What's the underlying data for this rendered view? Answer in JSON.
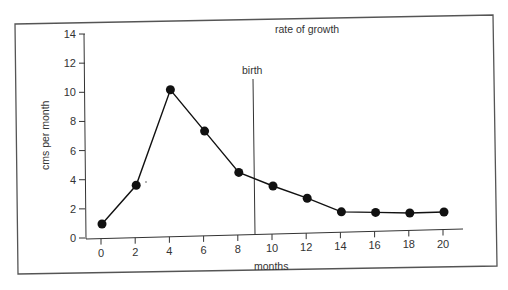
{
  "chart_data": {
    "type": "line",
    "title": "rate of growth",
    "xlabel": "months",
    "ylabel": "cms per month",
    "x": [
      0,
      2,
      4,
      6,
      8,
      10,
      12,
      14,
      16,
      18,
      20
    ],
    "series": [
      {
        "name": "rate of growth",
        "values": [
          1.0,
          3.6,
          10.1,
          7.2,
          4.3,
          3.3,
          2.4,
          1.4,
          1.3,
          1.2,
          1.2
        ]
      }
    ],
    "x_ticks": [
      "0",
      "2",
      "4",
      "6",
      "8",
      "10",
      "12",
      "14",
      "16",
      "18",
      "20"
    ],
    "y_ticks": [
      "0",
      "2",
      "4",
      "6",
      "8",
      "10",
      "12",
      "14"
    ],
    "xlim": [
      0,
      21
    ],
    "ylim": [
      0,
      14
    ],
    "grid": false,
    "legend": null,
    "annotations": [
      {
        "type": "vline",
        "x": 9.1,
        "label": "birth"
      }
    ]
  },
  "labels": {
    "title": "rate of growth",
    "xlabel": "months",
    "ylabel": "cms per month",
    "birth": "birth"
  }
}
